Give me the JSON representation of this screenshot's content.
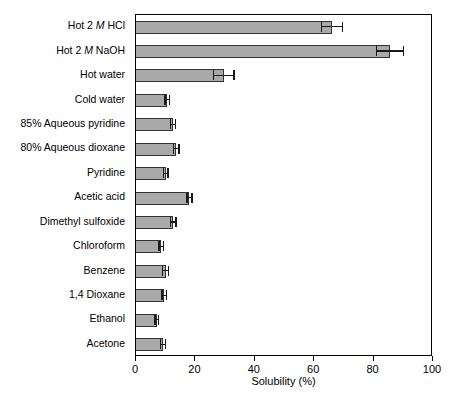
{
  "chart_data": {
    "type": "bar",
    "orientation": "horizontal",
    "title": "",
    "xlabel": "Solubility (%)",
    "ylabel": "",
    "xlim": [
      0,
      100
    ],
    "xticks": [
      0,
      20,
      40,
      60,
      80,
      100
    ],
    "xtick_labels": [
      "0",
      "20",
      "40",
      "60",
      "80",
      "100"
    ],
    "grid": false,
    "legend": false,
    "categories": [
      "Hot 2 M HCl",
      "Hot 2 M NaOH",
      "Hot water",
      "Cold water",
      "85% Aqueous pyridine",
      "80% Aqueous dioxane",
      "Pyridine",
      "Acetic acid",
      "Dimethyl sulfoxide",
      "Chloroform",
      "Benzene",
      "1,4 Dioxane",
      "Ethanol",
      "Acetone"
    ],
    "values": [
      66,
      85.5,
      29.5,
      10.5,
      12.5,
      13.5,
      10,
      18,
      12.5,
      8.5,
      10,
      9.5,
      7,
      9
    ],
    "errors": [
      3.5,
      4.5,
      3.5,
      0.8,
      0.8,
      1.0,
      0.8,
      0.8,
      1.0,
      0.8,
      1.0,
      0.8,
      0.6,
      0.8
    ],
    "bar_fill_color": "#a9a9a9",
    "bar_edge_color": "#333333",
    "axis_color": "#000000"
  },
  "labels": [
    {
      "pre": "Hot 2 ",
      "italic": "M",
      "post": " HCl"
    },
    {
      "pre": "Hot 2 ",
      "italic": "M",
      "post": " NaOH"
    },
    {
      "pre": "Hot water",
      "italic": "",
      "post": ""
    },
    {
      "pre": "Cold water",
      "italic": "",
      "post": ""
    },
    {
      "pre": "85% Aqueous pyridine",
      "italic": "",
      "post": ""
    },
    {
      "pre": "80% Aqueous dioxane",
      "italic": "",
      "post": ""
    },
    {
      "pre": "Pyridine",
      "italic": "",
      "post": ""
    },
    {
      "pre": "Acetic acid",
      "italic": "",
      "post": ""
    },
    {
      "pre": "Dimethyl sulfoxide",
      "italic": "",
      "post": ""
    },
    {
      "pre": "Chloroform",
      "italic": "",
      "post": ""
    },
    {
      "pre": "Benzene",
      "italic": "",
      "post": ""
    },
    {
      "pre": "1,4 Dioxane",
      "italic": "",
      "post": ""
    },
    {
      "pre": "Ethanol",
      "italic": "",
      "post": ""
    },
    {
      "pre": "Acetone",
      "italic": "",
      "post": ""
    }
  ]
}
